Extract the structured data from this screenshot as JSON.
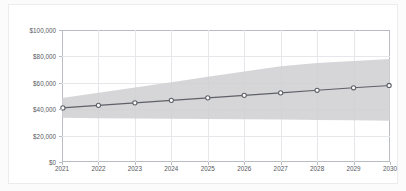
{
  "card": {
    "background": "#ffffff",
    "border_color": "#ececef"
  },
  "chart_data": {
    "type": "line",
    "title": "",
    "xlabel": "",
    "ylabel": "",
    "x": [
      2021,
      2022,
      2023,
      2024,
      2025,
      2026,
      2027,
      2028,
      2029,
      2030
    ],
    "x_tick_labels": [
      "2021",
      "2022",
      "2023",
      "2024",
      "2025",
      "2026",
      "2027",
      "2028",
      "2029",
      "2030"
    ],
    "y_tick_labels": [
      "$0",
      "$20,000",
      "$40,000",
      "$60,000",
      "$80,000",
      "$100,000"
    ],
    "y_ticks": [
      0,
      20000,
      40000,
      60000,
      80000,
      100000
    ],
    "ylim": [
      0,
      100000
    ],
    "xlim": [
      2021,
      2030
    ],
    "grid": true,
    "legend": false,
    "series": [
      {
        "name": "projection",
        "type": "line",
        "color": "#5f6168",
        "marker": "circle-open",
        "values": [
          41000,
          42900,
          44800,
          46700,
          48600,
          50500,
          52400,
          54300,
          56200,
          58000
        ]
      }
    ],
    "band": {
      "name": "confidence-interval",
      "color": "#cfcfd2",
      "opacity": 0.85,
      "lower": [
        33500,
        33200,
        33000,
        32800,
        32600,
        32400,
        32200,
        31900,
        31600,
        31200
      ],
      "upper": [
        48500,
        52500,
        56500,
        60500,
        64500,
        68500,
        72500,
        75000,
        76500,
        78000
      ]
    }
  }
}
